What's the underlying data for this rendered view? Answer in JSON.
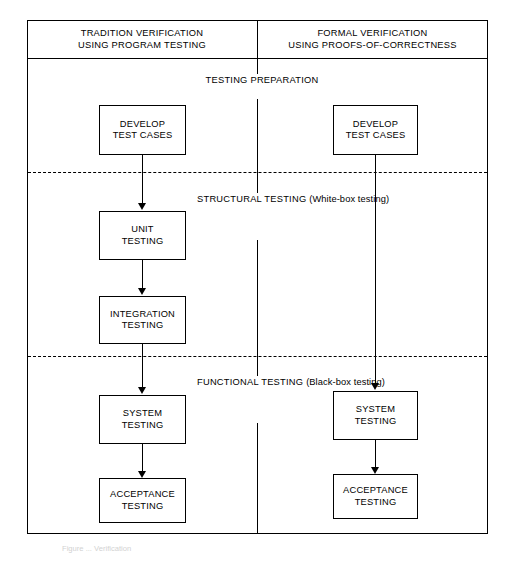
{
  "figure": {
    "caption": "Figure ... Verification"
  },
  "header": {
    "left_column": {
      "line1": "TRADITION VERIFICATION",
      "line2": "USING PROGRAM TESTING"
    },
    "right_column": {
      "line1": "FORMAL VERIFICATION",
      "line2": "USING PROOFS-OF-CORRECTNESS"
    }
  },
  "stages": [
    {
      "id": "testing-preparation",
      "line1": "TESTING",
      "line2": "PREPARATION",
      "sub": ""
    },
    {
      "id": "structural-testing",
      "line1": "STRUCTURAL",
      "line2": "TESTING",
      "sub": "(White-box testing)"
    },
    {
      "id": "functional-testing",
      "line1": "FUNCTIONAL",
      "line2": "TESTING",
      "sub": "(Black-box testing)"
    }
  ],
  "left_flow": {
    "boxes": [
      {
        "id": "develop-test-cases",
        "line1": "DEVELOP",
        "line2": "TEST CASES"
      },
      {
        "id": "unit-testing",
        "line1": "UNIT",
        "line2": "TESTING"
      },
      {
        "id": "integration-testing",
        "line1": "INTEGRATION",
        "line2": "TESTING"
      },
      {
        "id": "system-testing",
        "line1": "SYSTEM",
        "line2": "TESTING"
      },
      {
        "id": "acceptance-testing",
        "line1": "ACCEPTANCE",
        "line2": "TESTING"
      }
    ]
  },
  "right_flow": {
    "boxes": [
      {
        "id": "develop-test-cases",
        "line1": "DEVELOP",
        "line2": "TEST CASES"
      },
      {
        "id": "system-testing",
        "line1": "SYSTEM",
        "line2": "TESTING"
      },
      {
        "id": "acceptance-testing",
        "line1": "ACCEPTANCE",
        "line2": "TESTING"
      }
    ]
  },
  "colors": {
    "line": "#000000",
    "background": "#ffffff"
  }
}
